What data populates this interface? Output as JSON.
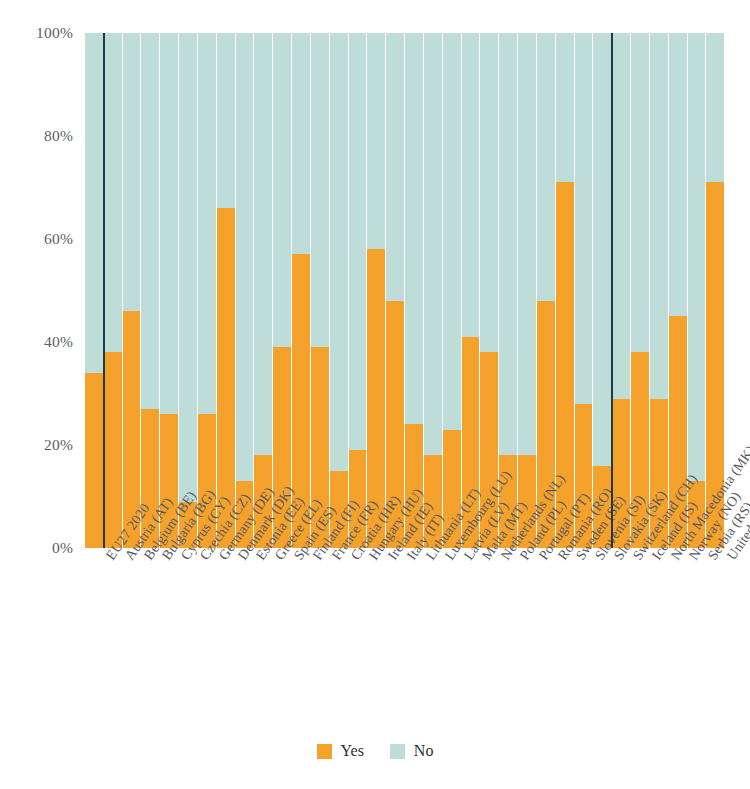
{
  "chart_data": {
    "type": "bar",
    "subtype": "stacked-bar-100",
    "title": "",
    "subtitle": "",
    "xlabel": "",
    "ylabel": "",
    "ylim": [
      0,
      100
    ],
    "yticks": [
      0,
      20,
      40,
      60,
      80,
      100
    ],
    "ytick_labels": [
      "0%",
      "20%",
      "40%",
      "60%",
      "80%",
      "100%"
    ],
    "grid": true,
    "legend_position": "bottom-center",
    "colors": {
      "yes": "#f5a22d",
      "no": "#bedcd8",
      "separator": "#1d3b42",
      "gridline": "#ffffff",
      "text": "#55595f",
      "background": "#ffffff"
    },
    "legend": [
      {
        "name": "Yes",
        "color": "#f5a22d"
      },
      {
        "name": "No",
        "color": "#bedcd8"
      }
    ],
    "categories": [
      "EU27 2020",
      "Austria (AT)",
      "Belgium (BE)",
      "Bulgaria (BG)",
      "Cyprus (CY)",
      "Czechia (CZ)",
      "Germany (DE)",
      "Denmark (DK)",
      "Estonia (EE)",
      "Greece (EL)",
      "Spain (ES)",
      "Finland (FI)",
      "France (FR)",
      "Croatia (HR)",
      "Hungary (HU)",
      "Ireland (IE)",
      "Italy (IT)",
      "Lithuania (LT)",
      "Luxembourg (LU)",
      "Latvia (LV)",
      "Malta (MT)",
      "Netherlands (NL)",
      "Poland (PL)",
      "Portugal (PT)",
      "Romania (RO)",
      "Sweden (SE)",
      "Slovenia (SI)",
      "Slovakia (SK)",
      "Switzerland (CH)",
      "Iceland (IS)",
      "North Macedonia (MK)",
      "Norway (NO)",
      "Serbia (RS)",
      "United Kingdom (UK)"
    ],
    "series": [
      {
        "name": "Yes",
        "color": "#f5a22d",
        "values": [
          34,
          38,
          46,
          27,
          26,
          9,
          26,
          66,
          13,
          18,
          39,
          57,
          39,
          15,
          19,
          58,
          48,
          24,
          18,
          23,
          41,
          38,
          18,
          18,
          48,
          71,
          28,
          16,
          29,
          38,
          29,
          45,
          13,
          71
        ]
      },
      {
        "name": "No",
        "color": "#bedcd8",
        "values": [
          66,
          62,
          54,
          73,
          74,
          91,
          74,
          34,
          87,
          82,
          61,
          43,
          61,
          85,
          81,
          42,
          52,
          76,
          82,
          77,
          59,
          62,
          82,
          82,
          52,
          29,
          72,
          84,
          71,
          62,
          71,
          55,
          87,
          29
        ]
      }
    ],
    "group_separators_after": [
      "EU27 2020",
      "Slovakia (SK)"
    ],
    "annotations": []
  }
}
